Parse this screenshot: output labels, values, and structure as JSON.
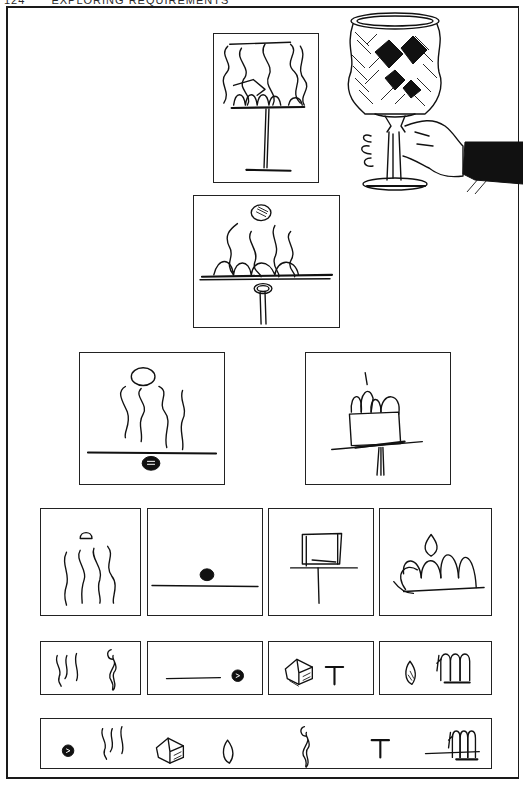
{
  "page": {
    "number": "124",
    "running_head": "EXPLORING REQUIREMENTS"
  },
  "figure": {
    "rows": [
      {
        "row": 1,
        "items": [
          {
            "id": "goblet-sketch",
            "label": "Goblet line sketch"
          },
          {
            "id": "goblet-in-hand",
            "label": "Decorated goblet held in hand"
          }
        ]
      },
      {
        "row": 2,
        "items": [
          {
            "id": "goblet-abstracted",
            "label": "Wavy lines, arches and knob on plate with stem"
          }
        ]
      },
      {
        "row": 3,
        "items": [
          {
            "id": "waves-and-knob",
            "label": "Wavy lines with ellipse above horizon line and knob"
          },
          {
            "id": "box-with-arches",
            "label": "Box with arches on tilted plate and stem"
          }
        ]
      },
      {
        "row": 4,
        "items": [
          {
            "id": "waves",
            "label": "Four wavy lines with small ellipse"
          },
          {
            "id": "line-with-dot",
            "label": "Horizon line with dark dot"
          },
          {
            "id": "table-shape",
            "label": "Box on T-shaped stand"
          },
          {
            "id": "arches",
            "label": "Arches with flame shape"
          }
        ]
      },
      {
        "row": 5,
        "items": [
          {
            "id": "glyph-waves-twist",
            "label": "Wavy lines and twisted stem glyph"
          },
          {
            "id": "glyph-line-dot",
            "label": "Line and dot glyph"
          },
          {
            "id": "glyph-box-t",
            "label": "Box and T glyph"
          },
          {
            "id": "glyph-flame-arches",
            "label": "Flame and arches glyph"
          }
        ]
      },
      {
        "row": 6,
        "items": [
          {
            "id": "glyph-strip",
            "label": "Dot, waves, box, flame, twist, T, line, arches"
          }
        ]
      }
    ]
  }
}
